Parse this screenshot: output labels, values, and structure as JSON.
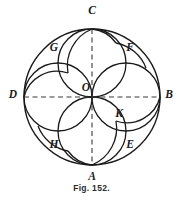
{
  "figure": {
    "caption": "Fig. 152.",
    "colors": {
      "stroke": "#1a1a1a",
      "dashed_stroke": "#3a3a3a",
      "background": "#ffffff",
      "label_color": "#1a1a1a"
    },
    "geometry": {
      "center": {
        "x": 92,
        "y": 97,
        "label": "O"
      },
      "outer_circle_radius": 68,
      "inner_circle_radius": 34,
      "small_arc_radius": 17
    },
    "axis_points": [
      {
        "id": "C",
        "label": "C",
        "position": "top",
        "x": 92,
        "y": 29,
        "label_x": 92,
        "label_y": 11
      },
      {
        "id": "A",
        "label": "A",
        "position": "bottom",
        "x": 92,
        "y": 165,
        "label_x": 92,
        "label_y": 177
      },
      {
        "id": "D",
        "label": "D",
        "position": "left",
        "x": 24,
        "y": 97,
        "label_x": 13,
        "label_y": 95
      },
      {
        "id": "B",
        "label": "B",
        "position": "right",
        "x": 160,
        "y": 97,
        "label_x": 169,
        "label_y": 95
      }
    ],
    "arc_points": [
      {
        "id": "G",
        "label": "G",
        "quadrant": "upper-left",
        "label_x": 54,
        "label_y": 48
      },
      {
        "id": "F",
        "label": "F",
        "quadrant": "upper-right",
        "label_x": 130,
        "label_y": 48
      },
      {
        "id": "H",
        "label": "H",
        "quadrant": "lower-left",
        "label_x": 54,
        "label_y": 145
      },
      {
        "id": "E",
        "label": "E",
        "quadrant": "lower-right",
        "label_x": 130,
        "label_y": 145
      },
      {
        "id": "K",
        "label": "K",
        "quadrant": "inner-right",
        "label_x": 119,
        "label_y": 114
      }
    ],
    "dashed_axes": [
      {
        "id": "vertical-axis",
        "from": "C",
        "to": "A"
      },
      {
        "id": "horizontal-axis",
        "from": "D",
        "to": "B"
      }
    ]
  }
}
